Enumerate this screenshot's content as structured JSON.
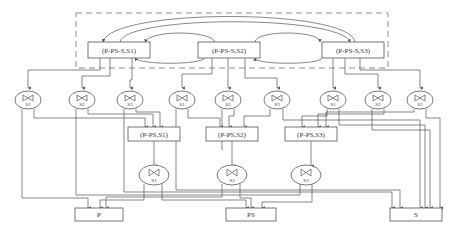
{
  "diagram": {
    "top_group": {
      "boxes": [
        {
          "label": "(P-PS-S,S1)"
        },
        {
          "label": "(P-PS-S,S2)"
        },
        {
          "label": "(P-PS-S,S3)"
        }
      ]
    },
    "valves_row1": [
      {
        "label": "S1"
      },
      {
        "label": "S2"
      },
      {
        "label": "S3"
      },
      {
        "label": "S1"
      },
      {
        "label": "S2"
      },
      {
        "label": "S3"
      },
      {
        "label": "S1"
      },
      {
        "label": "S2"
      },
      {
        "label": "S3"
      }
    ],
    "middle_boxes": [
      {
        "label": "(P-PS,S1)"
      },
      {
        "label": "(P-PS,S2)"
      },
      {
        "label": "(P-PS,S3)"
      }
    ],
    "valves_row2": [
      {
        "label": "S1"
      },
      {
        "label": "S2"
      },
      {
        "label": "S3"
      }
    ],
    "outputs": [
      {
        "label": "P"
      },
      {
        "label": "PS"
      },
      {
        "label": "S"
      }
    ]
  }
}
